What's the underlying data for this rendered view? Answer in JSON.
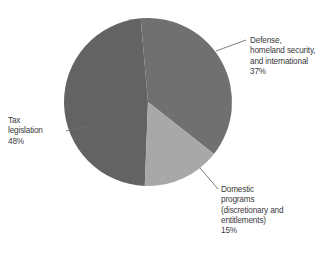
{
  "chart_data": {
    "type": "pie",
    "title": "",
    "subtitle": "",
    "xlabel": "",
    "ylabel": "",
    "grid": false,
    "legend_position": "none",
    "labels_position": "callout-outside",
    "units": "percent",
    "total": 100,
    "categories": [
      "Defense, homeland security, and international",
      "Domestic programs (discretionary and entitlements)",
      "Tax legislation"
    ],
    "values": [
      37,
      15,
      48
    ],
    "slices": [
      {
        "name": "Defense, homeland security, and international",
        "value": 37,
        "value_label": "37%",
        "color": "#707070",
        "start_angle_deg": 355,
        "end_angle_deg": 488.2,
        "label_lines": [
          "Defense,",
          "homeland security,",
          "and international",
          "37%"
        ]
      },
      {
        "name": "Domestic programs (discretionary and entitlements)",
        "value": 15,
        "value_label": "15%",
        "color": "#a8a8a8",
        "start_angle_deg": 488.2,
        "end_angle_deg": 542.2,
        "label_lines": [
          "Domestic",
          "programs",
          "(discretionary and",
          "entitlements)",
          "15%"
        ]
      },
      {
        "name": "Tax legislation",
        "value": 48,
        "value_label": "48%",
        "color": "#636363",
        "start_angle_deg": 542.2,
        "end_angle_deg": 715,
        "label_lines": [
          "Tax",
          "legislation",
          "48%"
        ]
      }
    ]
  },
  "figure": {
    "background_color": "#ffffff",
    "leader_line_color": "#6e6e6e"
  },
  "labels": {
    "defense": "Defense,\nhomeland security,\nand international\n37%",
    "domestic": "Domestic\nprograms\n(discretionary and\nentitlements)\n15%",
    "tax": "Tax\nlegislation\n48%"
  }
}
